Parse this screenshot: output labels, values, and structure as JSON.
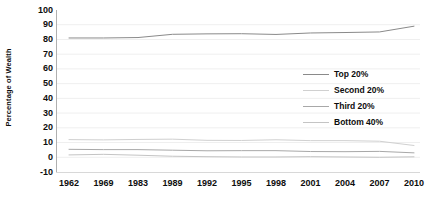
{
  "chart_data": {
    "type": "line",
    "title": "",
    "xlabel": "",
    "ylabel": "Percentage of Wealth",
    "x": [
      "1962",
      "1969",
      "1983",
      "1989",
      "1992",
      "1995",
      "1998",
      "2001",
      "2004",
      "2007",
      "2010"
    ],
    "categories": [
      "1962",
      "1969",
      "1983",
      "1989",
      "1992",
      "1995",
      "1998",
      "2001",
      "2004",
      "2007",
      "2010"
    ],
    "ylim": [
      -10,
      100
    ],
    "yticks": [
      100,
      90,
      80,
      70,
      60,
      50,
      40,
      30,
      20,
      10,
      0,
      -10
    ],
    "ytick_labels": [
      "100",
      "90",
      "80",
      "70",
      "60",
      "50",
      "40",
      "30",
      "20",
      "10",
      "0",
      "-10"
    ],
    "grid": true,
    "legend_position": "center-right-inside",
    "series": [
      {
        "name": "Top 20%",
        "color": "#8a8a8a",
        "values": [
          81,
          81,
          81.3,
          83.5,
          83.8,
          83.9,
          83.4,
          84.4,
          84.7,
          85.1,
          89
        ]
      },
      {
        "name": "Second 20%",
        "color": "#d0d0d0",
        "values": [
          12.0,
          11.8,
          12.1,
          12.3,
          11.5,
          11.4,
          11.9,
          11.3,
          11.3,
          10.9,
          8.0
        ]
      },
      {
        "name": "Third 20%",
        "color": "#a8a8a8",
        "values": [
          5.4,
          5.2,
          5.2,
          4.8,
          4.4,
          4.5,
          4.5,
          3.9,
          3.8,
          4.0,
          3.0
        ]
      },
      {
        "name": "Bottom 40%",
        "color": "#c4c4c4",
        "values": [
          1.6,
          2.0,
          1.4,
          0.7,
          0.4,
          0.2,
          0.2,
          0.4,
          0.2,
          0.0,
          0.3
        ]
      }
    ]
  },
  "axes": {
    "y_title": "Percentage of Wealth"
  },
  "legend": {
    "items": [
      {
        "label": "Top 20%"
      },
      {
        "label": "Second 20%"
      },
      {
        "label": "Third 20%"
      },
      {
        "label": "Bottom 40%"
      }
    ]
  },
  "colors": {
    "background": "#ffffff",
    "text": "#0d0d0d",
    "gridline": "#efefef",
    "axis": "#b0b0b0"
  }
}
